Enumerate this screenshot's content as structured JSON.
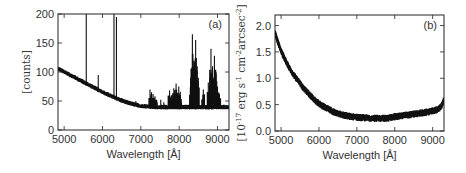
{
  "chart_data": [
    {
      "type": "line",
      "panel_label": "(a)",
      "title": "",
      "xlabel": "Wavelength [Å]",
      "ylabel": "[counts]",
      "xlim": [
        4840,
        9300
      ],
      "ylim": [
        0,
        200
      ],
      "xticks": [
        5000,
        6000,
        7000,
        8000,
        9000
      ],
      "xtick_labels": [
        "5000",
        "6000",
        "7000",
        "8000",
        "9000"
      ],
      "yticks": [
        0,
        50,
        100,
        150,
        200
      ],
      "ytick_labels": [
        "0",
        "50",
        "100",
        "150",
        "200"
      ],
      "grid": false,
      "series": [
        {
          "name": "sky spectrum",
          "color": "#111111",
          "continuum": {
            "x": [
              4850,
              5000,
              5200,
              5400,
              5600,
              5800,
              6000,
              6200,
              6400,
              6600,
              6800,
              7000,
              7200,
              7400,
              7600,
              7800,
              8000,
              8200,
              8400,
              8600,
              8800,
              9000,
              9200,
              9300
            ],
            "y": [
              105,
              100,
              93,
              86,
              79,
              72,
              65,
              59,
              53,
              48,
              44,
              41,
              40,
              39,
              39,
              39,
              39,
              39,
              39,
              39,
              39,
              39,
              39,
              39
            ]
          },
          "emission_lines": [
            {
              "x": 5577,
              "y": 200
            },
            {
              "x": 5890,
              "y": 95
            },
            {
              "x": 6300,
              "y": 200
            },
            {
              "x": 6364,
              "y": 195
            },
            {
              "x": 5460,
              "y": 85
            },
            {
              "x": 6500,
              "y": 55
            },
            {
              "x": 6870,
              "y": 50
            },
            {
              "x": 7240,
              "y": 70
            },
            {
              "x": 7280,
              "y": 65
            },
            {
              "x": 7320,
              "y": 62
            },
            {
              "x": 7370,
              "y": 58
            },
            {
              "x": 7520,
              "y": 52
            },
            {
              "x": 7600,
              "y": 48
            },
            {
              "x": 7750,
              "y": 68
            },
            {
              "x": 7800,
              "y": 60
            },
            {
              "x": 7860,
              "y": 72
            },
            {
              "x": 7920,
              "y": 80
            },
            {
              "x": 7990,
              "y": 75
            },
            {
              "x": 8030,
              "y": 66
            },
            {
              "x": 8300,
              "y": 90
            },
            {
              "x": 8345,
              "y": 165
            },
            {
              "x": 8380,
              "y": 120
            },
            {
              "x": 8400,
              "y": 110
            },
            {
              "x": 8430,
              "y": 155
            },
            {
              "x": 8470,
              "y": 110
            },
            {
              "x": 8500,
              "y": 90
            },
            {
              "x": 8630,
              "y": 70
            },
            {
              "x": 8760,
              "y": 82
            },
            {
              "x": 8830,
              "y": 140
            },
            {
              "x": 8870,
              "y": 110
            },
            {
              "x": 8920,
              "y": 128
            },
            {
              "x": 8960,
              "y": 100
            },
            {
              "x": 9000,
              "y": 75
            },
            {
              "x": 9050,
              "y": 62
            }
          ]
        }
      ]
    },
    {
      "type": "line",
      "panel_label": "(b)",
      "title": "",
      "xlabel": "Wavelength [Å]",
      "ylabel": "[10⁻¹⁷ erg s⁻¹ cm⁻² arcsec⁻²]",
      "ylabel_parts": {
        "base": "[10",
        "exp1": "-17",
        "mid1": " erg s",
        "exp2": "-1",
        "mid2": " cm",
        "exp3": "-2",
        "mid3": "arcsec",
        "exp4": "-2",
        "end": "]"
      },
      "xlim": [
        4840,
        9300
      ],
      "ylim": [
        0,
        2.2
      ],
      "xticks": [
        5000,
        6000,
        7000,
        8000,
        9000
      ],
      "xtick_labels": [
        "5000",
        "6000",
        "7000",
        "8000",
        "9000"
      ],
      "yticks": [
        0.0,
        0.5,
        1.0,
        1.5,
        2.0
      ],
      "ytick_labels": [
        "0.0",
        "0.5",
        "1.0",
        "1.5",
        "2.0"
      ],
      "grid": false,
      "series": [
        {
          "name": "sky surface brightness",
          "color": "#111111",
          "x": [
            4850,
            4900,
            5000,
            5100,
            5200,
            5300,
            5400,
            5500,
            5600,
            5700,
            5800,
            5900,
            6000,
            6200,
            6400,
            6600,
            6800,
            7000,
            7200,
            7400,
            7600,
            7800,
            8000,
            8200,
            8400,
            8600,
            8800,
            9000,
            9100,
            9200,
            9250,
            9300
          ],
          "y": [
            1.85,
            1.72,
            1.52,
            1.36,
            1.22,
            1.1,
            1.0,
            0.9,
            0.8,
            0.73,
            0.65,
            0.58,
            0.52,
            0.43,
            0.36,
            0.31,
            0.28,
            0.26,
            0.25,
            0.24,
            0.24,
            0.24,
            0.27,
            0.29,
            0.31,
            0.33,
            0.35,
            0.38,
            0.4,
            0.44,
            0.5,
            0.6
          ]
        }
      ]
    }
  ]
}
